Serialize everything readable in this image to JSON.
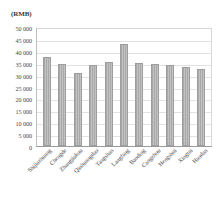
{
  "chart_data": {
    "type": "bar",
    "title": "",
    "subtitle": "",
    "unit_label": "(RMB)",
    "xlabel": "",
    "ylabel": "",
    "ylim": [
      0,
      50000
    ],
    "ytick_step": 5000,
    "grid": true,
    "legend": "none",
    "bar_color": "#b4b4b4",
    "bar_edge_color": "#9d9d9d",
    "grid_color": "#e2e2e2",
    "axis_color": "#9a9a9a",
    "ytick_labels": [
      "50 000",
      "45 000",
      "40 000",
      "35 000",
      "30 000",
      "25 000",
      "20 000",
      "15 000",
      "10 000",
      "5 000",
      "0"
    ],
    "ytick_values": [
      50000,
      45000,
      40000,
      35000,
      30000,
      25000,
      20000,
      15000,
      10000,
      5000,
      0
    ],
    "categories": [
      "Shijiazhuang",
      "Chengde",
      "Zhangjiakou",
      "Qinhuangdao",
      "Tangshan",
      "Langfang",
      "Baoding",
      "Cangzhou",
      "Hengshui",
      "Xingtai",
      "Handan"
    ],
    "values": [
      37500,
      34500,
      30500,
      34000,
      35500,
      43000,
      35000,
      34500,
      34000,
      33000,
      32500
    ]
  }
}
